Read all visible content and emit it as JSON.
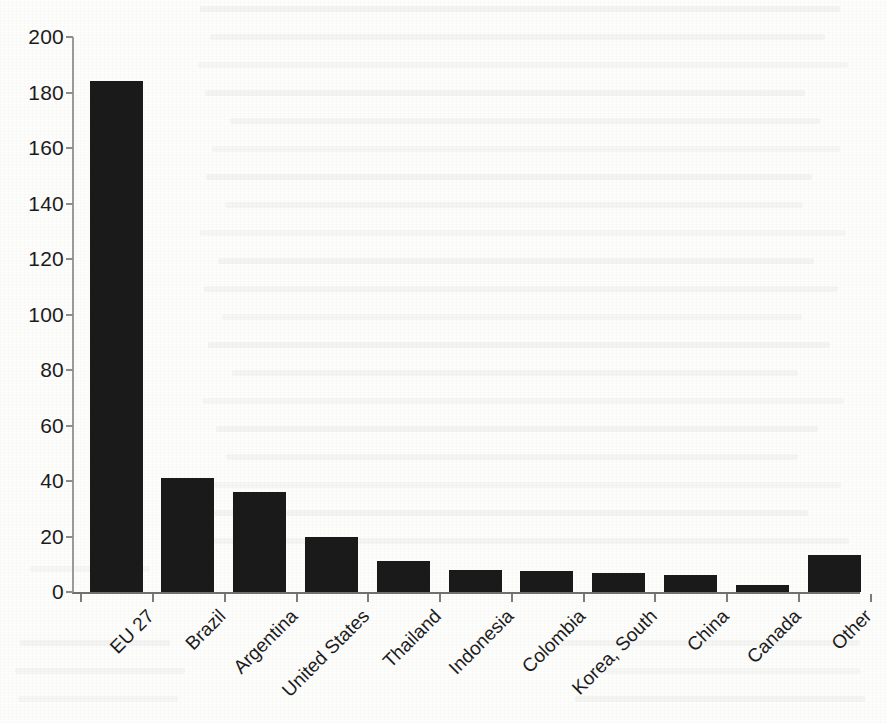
{
  "chart_data": {
    "type": "bar",
    "title": "",
    "subtitle": "",
    "xlabel": "",
    "ylabel": "",
    "categories": [
      "EU 27",
      "Brazil",
      "Argentina",
      "United States",
      "Thailand",
      "Indonesia",
      "Colombia",
      "Korea, South",
      "China",
      "Canada",
      "Other"
    ],
    "values": [
      184,
      41,
      36,
      20,
      11,
      8,
      7.5,
      7,
      6,
      2.5,
      13.5
    ],
    "ylim": [
      0,
      200
    ],
    "ytick_labels": [
      "0",
      "20",
      "40",
      "60",
      "80",
      "100",
      "120",
      "140",
      "160",
      "180",
      "200"
    ],
    "ytick_values": [
      0,
      20,
      40,
      60,
      80,
      100,
      120,
      140,
      160,
      180,
      200
    ],
    "grid": false,
    "legend": null,
    "legend_position": "none",
    "bar_color": "#1a1a1a",
    "axis_color": "#7b7b79",
    "background_color": "#fdfdfc",
    "xtick_label_rotation": -45,
    "annotations": []
  },
  "axis": {
    "y_axis_label": "",
    "x_axis_label": ""
  }
}
